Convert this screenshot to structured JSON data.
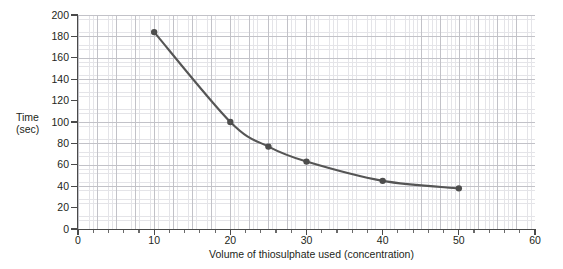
{
  "chart_data": {
    "type": "line",
    "title": "",
    "xlabel": "Volume of thiosulphate used (concentration)",
    "ylabel": "Time (sec)",
    "ylabel_lines": [
      "Time",
      "(sec)"
    ],
    "xlim": [
      0,
      60
    ],
    "ylim": [
      0,
      200
    ],
    "x_ticks": [
      0,
      10,
      20,
      30,
      40,
      50,
      60
    ],
    "y_ticks": [
      0,
      20,
      40,
      60,
      80,
      100,
      120,
      140,
      160,
      180,
      200
    ],
    "x_tick_labels": [
      "0",
      "10",
      "20",
      "30",
      "40",
      "50",
      "60"
    ],
    "y_tick_labels": [
      "0",
      "20",
      "40",
      "60",
      "80",
      "100",
      "120",
      "140",
      "160",
      "180",
      "200"
    ],
    "grid": true,
    "grid_major_step_x": 5,
    "grid_minor_step_x": 1,
    "grid_major_step_y": 20,
    "grid_minor_step_y": 4,
    "legend": null,
    "series": [
      {
        "name": "Time vs volume of thiosulphate",
        "marker": "filled-circle",
        "color": "#555555",
        "x": [
          10,
          20,
          25,
          30,
          40,
          50
        ],
        "y": [
          184,
          100,
          77,
          63,
          45,
          38
        ],
        "points": [
          {
            "x": 10,
            "y": 184
          },
          {
            "x": 20,
            "y": 100
          },
          {
            "x": 25,
            "y": 77
          },
          {
            "x": 30,
            "y": 63
          },
          {
            "x": 40,
            "y": 45
          },
          {
            "x": 50,
            "y": 38
          }
        ]
      }
    ],
    "colors": {
      "curve": "#555555",
      "marker": "#4d4d4d",
      "axis": "#4a4a4a",
      "grid_major": "#c2c2c8",
      "grid_minor": "#e4e4e8",
      "text": "#231f20",
      "background": "#ffffff"
    }
  }
}
